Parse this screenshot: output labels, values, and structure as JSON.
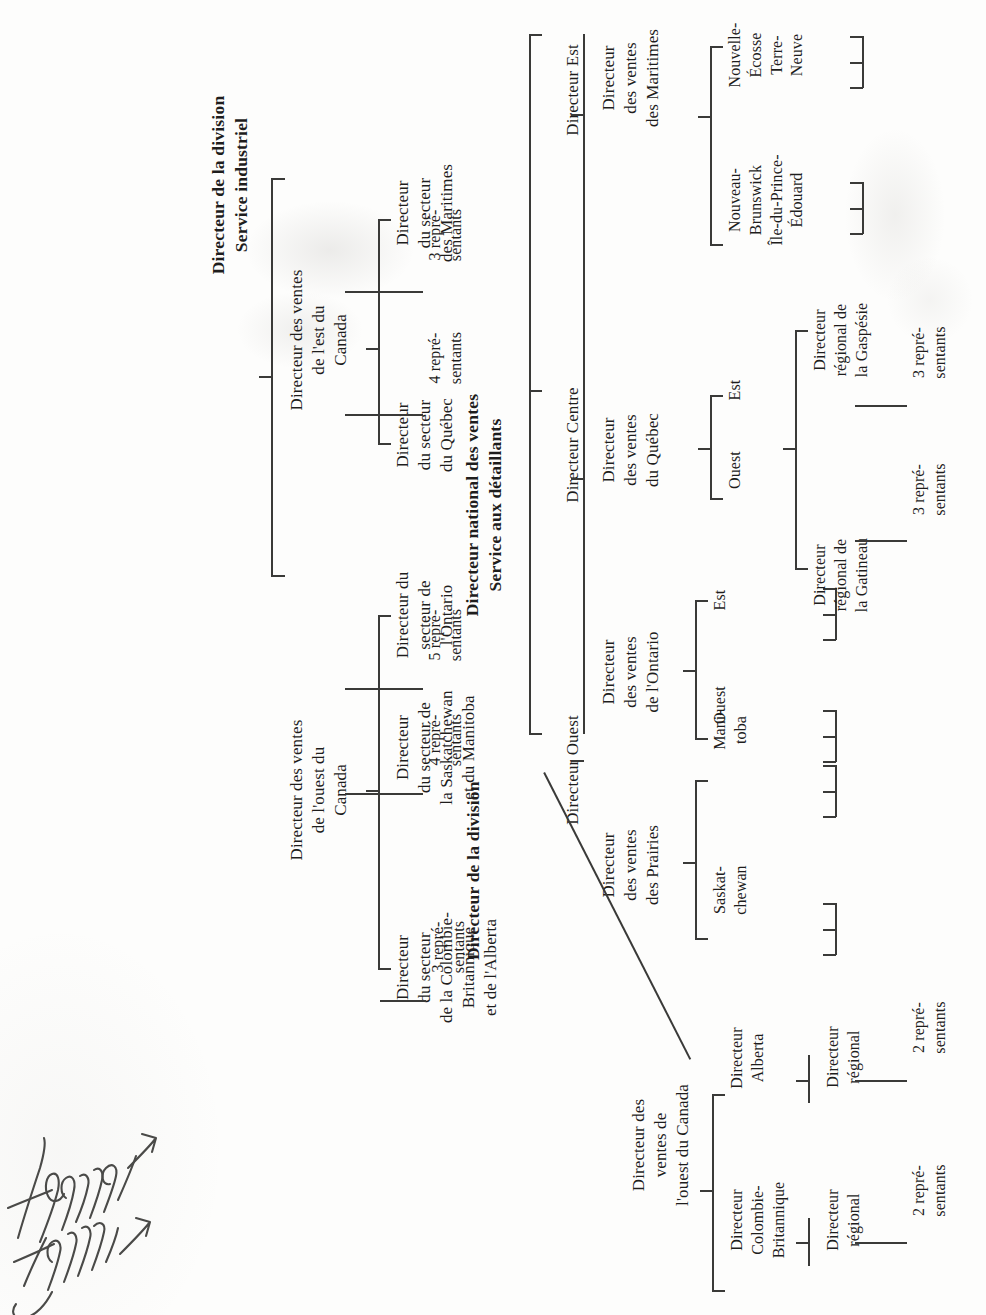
{
  "page": {
    "language": "fr",
    "background_color": "#fdfdfc",
    "ink_color": "#1e1d1c",
    "rule_color": "#3a3a38",
    "orientation": "text rotated 90 degrees counter-clockwise",
    "handwriting_note": "Technology gamme"
  },
  "chart1": {
    "title_line1": "Directeur de la division",
    "title_line2": "Service industriel",
    "nodes": {
      "west_l1": "Directeur des ventes\nde l'ouest du\nCanada",
      "east_l1": "Directeur des ventes\nde l'est du\nCanada",
      "bc": "Directeur\ndu secteur\nde la Colombie-\nBritannique\net de l'Alberta",
      "sask_man": "Directeur\ndu secteur de\nla Saskatchewan\net du Manitoba",
      "ontario": "Directeur du\nsecteur de\nl'Ontario",
      "quebec": "Directeur\ndu secteur\ndu Québec",
      "maritimes": "Directeur\ndu secteur\ndes Maritimes",
      "reps_bc": "3 repré-\nsentants",
      "reps_sask": "4 repré-\nsentants",
      "reps_ont": "5 repré-\nsentants",
      "reps_qc": "4 repré-\nsentants",
      "reps_mar": "3 repré-\nsentants"
    }
  },
  "chart2": {
    "title_line1": "Directeur national des ventes",
    "title_line2": "Service aux détaillants",
    "subtitle": "Directeur de la division",
    "nodes": {
      "dir_ouest": "Directeur Ouest",
      "dir_centre": "Directeur Centre",
      "dir_est": "Directeur Est",
      "ventes_prairies": "Directeur\ndes ventes\ndes Prairies",
      "ventes_ontario": "Directeur\ndes ventes\nde l'Ontario",
      "ventes_quebec": "Directeur\ndes ventes\ndu Québec",
      "ventes_maritimes": "Directeur\ndes ventes\ndes Maritimes",
      "saskatchewan": "Saskat-\nchewan",
      "manitoba": "Mani-\ntoba",
      "ontario_ouest": "Ouest",
      "ontario_est": "Est",
      "quebec_ouest": "Ouest",
      "quebec_est": "Est",
      "gatineau": "Directeur\nrégional de\nla Gatineau",
      "gaspesie": "Directeur\nrégional de\nla Gaspésie",
      "reps_gatineau": "3 repré-\nsentants",
      "reps_gaspesie": "3 repré-\nsentants",
      "nouveau_brunswick": "Nouveau-\nBrunswick\nÎle-du-Prince-\nÉdouard",
      "nouvelle_ecosse": "Nouvelle-\nÉcosse\nTerre-\nNeuve"
    }
  },
  "chart3": {
    "nodes": {
      "west_root": "Directeur des\nventes de\nl'ouest du Canada",
      "bc": "Directeur\nColombie-\nBritannique",
      "alberta": "Directeur\nAlberta",
      "bc_regional": "Directeur\nrégional",
      "alberta_regional": "Directeur\nrégional",
      "reps_bc": "2 repré-\nsentants",
      "reps_alberta": "2 repré-\nsentants"
    }
  }
}
